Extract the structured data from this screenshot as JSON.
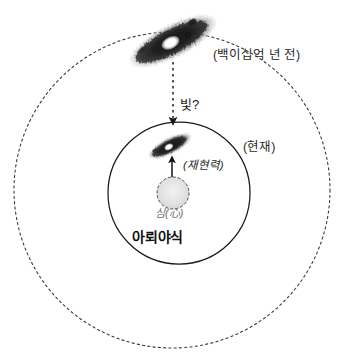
{
  "diagram": {
    "title_visible": false,
    "background_color": "#ffffff",
    "ink_color": "#1c1c1c",
    "labels": {
      "era_past": "(백이십억 년 전)",
      "era_present": "(현재)",
      "light_question": "빛?",
      "manifesting_power": "(재현력)",
      "mind": "심(心)",
      "alaya_consciousness": "아뢰야식"
    },
    "shapes": {
      "outer_orbit": {
        "name": "outer-dashed-circle",
        "center_x": 172,
        "center_y": 190,
        "radius": 158,
        "style": "dashed",
        "stroke": "#3a3a3a"
      },
      "inner_orbit": {
        "name": "inner-solid-circle",
        "center_x": 179,
        "center_y": 193,
        "radius": 71,
        "style": "solid",
        "stroke": "#1a1a1a"
      },
      "core_circle": {
        "name": "core-dashed-circle",
        "center_x": 173,
        "center_y": 193,
        "radius": 16,
        "style": "dashed",
        "fill": "#e2e2e2",
        "stroke": "#4a4a4a"
      },
      "outer_galaxy": {
        "name": "outer-galaxy",
        "center_x": 173,
        "center_y": 41,
        "length": 92,
        "thickness": 31,
        "rotation_deg": -27
      },
      "inner_galaxy": {
        "name": "inner-galaxy",
        "center_x": 170,
        "center_y": 146,
        "length": 46,
        "thickness": 16,
        "rotation_deg": -27
      },
      "light_arrow": {
        "name": "light-dashed-arrow",
        "x": 173,
        "y_start": 62,
        "y_end": 127,
        "style": "dashed",
        "direction": "down"
      },
      "power_arrow": {
        "name": "power-solid-arrow",
        "x": 172,
        "y_start": 178,
        "y_end": 154,
        "style": "solid",
        "direction": "up"
      }
    }
  }
}
